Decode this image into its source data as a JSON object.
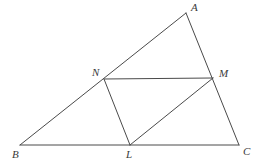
{
  "figure": {
    "type": "geometry-diagram",
    "width": 259,
    "height": 166,
    "background_color": "#ffffff",
    "stroke_color": "#4a4a4a",
    "label_color": "#3a3a3a",
    "stroke_width": 1,
    "points": [
      {
        "id": "A",
        "label": "A",
        "x": 186,
        "y": 13,
        "label_x": 191,
        "label_y": 2
      },
      {
        "id": "B",
        "label": "B",
        "x": 20,
        "y": 145,
        "label_x": 12,
        "label_y": 149
      },
      {
        "id": "C",
        "label": "C",
        "x": 239,
        "y": 145,
        "label_x": 243,
        "label_y": 146
      },
      {
        "id": "N",
        "label": "N",
        "x": 104,
        "y": 79,
        "label_x": 92,
        "label_y": 67
      },
      {
        "id": "M",
        "label": "M",
        "x": 213,
        "y": 78,
        "label_x": 219,
        "label_y": 68
      },
      {
        "id": "L",
        "label": "L",
        "x": 130,
        "y": 145,
        "label_x": 126,
        "label_y": 149
      }
    ],
    "segments": [
      {
        "id": "AB",
        "from": "A",
        "to": "B",
        "name": "side-ab"
      },
      {
        "id": "AC",
        "from": "A",
        "to": "C",
        "name": "side-ac"
      },
      {
        "id": "BC",
        "from": "B",
        "to": "C",
        "name": "side-bc"
      },
      {
        "id": "NM",
        "from": "N",
        "to": "M",
        "name": "segment-nm"
      },
      {
        "id": "NL",
        "from": "N",
        "to": "L",
        "name": "segment-nl"
      },
      {
        "id": "LM",
        "from": "L",
        "to": "M",
        "name": "segment-lm"
      }
    ]
  }
}
